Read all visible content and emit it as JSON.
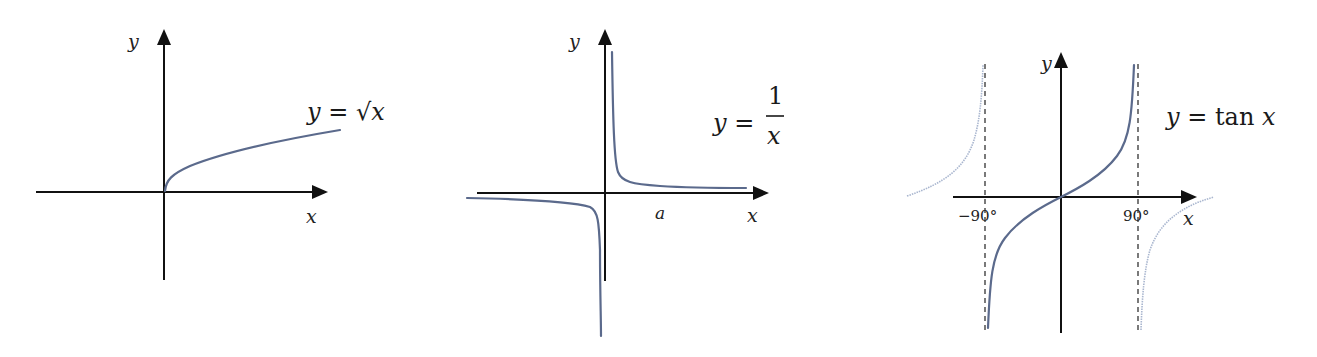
{
  "figure": {
    "panels": [
      {
        "id": "sqrt",
        "equation": {
          "lhs": "y",
          "eq": " = ",
          "rhs": "√x"
        },
        "x_label": "x",
        "y_label": "y"
      },
      {
        "id": "reciprocal",
        "equation": {
          "lhs": "y",
          "eq": " = ",
          "numerator": "1",
          "denominator": "x"
        },
        "x_label": "x",
        "y_label": "y",
        "tick_label": "a"
      },
      {
        "id": "tan",
        "equation": {
          "lhs": "y",
          "eq": " = ",
          "fn": "tan",
          "arg": "x"
        },
        "x_label": "x",
        "y_label": "y",
        "tick_labels": [
          "−90°",
          "90°"
        ]
      }
    ]
  },
  "colors": {
    "axis": "#111111",
    "curve": "#5b6a8c",
    "curve_light": "#a9b6cf",
    "asymptote": "#222222"
  }
}
